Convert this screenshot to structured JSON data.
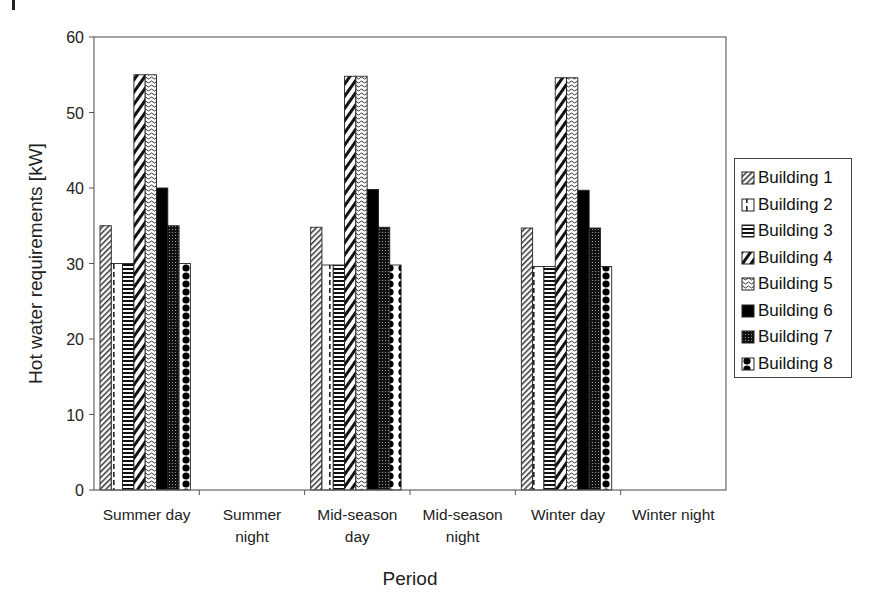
{
  "chart_data": {
    "type": "bar",
    "title": "",
    "xlabel": "Period",
    "ylabel": "Hot water requirements [kW]",
    "ylim": [
      0,
      60
    ],
    "yticks": [
      0,
      10,
      20,
      30,
      40,
      50,
      60
    ],
    "grid": false,
    "legend_position": "right",
    "categories": [
      "Summer day",
      "Summer night",
      "Mid-season day",
      "Mid-season night",
      "Winter day",
      "Winter night"
    ],
    "category_lines": [
      [
        "Summer day"
      ],
      [
        "Summer",
        "night"
      ],
      [
        "Mid-season",
        "day"
      ],
      [
        "Mid-season",
        "night"
      ],
      [
        "Winter day"
      ],
      [
        "Winter night"
      ]
    ],
    "series": [
      {
        "name": "Building 1",
        "pattern": "diag-fine",
        "values": [
          35,
          0,
          34.8,
          0,
          34.7,
          0
        ]
      },
      {
        "name": "Building 2",
        "pattern": "dashed-vertical",
        "values": [
          30,
          0,
          29.8,
          0,
          29.6,
          0
        ]
      },
      {
        "name": "Building 3",
        "pattern": "horizontal-stripes",
        "values": [
          30,
          0,
          29.8,
          0,
          29.6,
          0
        ]
      },
      {
        "name": "Building 4",
        "pattern": "diag-wide",
        "values": [
          55,
          0,
          54.8,
          0,
          54.6,
          0
        ]
      },
      {
        "name": "Building 5",
        "pattern": "wave",
        "values": [
          55,
          0,
          54.8,
          0,
          54.6,
          0
        ]
      },
      {
        "name": "Building 6",
        "pattern": "solid-black",
        "values": [
          40,
          0,
          39.8,
          0,
          39.7,
          0
        ]
      },
      {
        "name": "Building 7",
        "pattern": "dotted-dark",
        "values": [
          35,
          0,
          34.8,
          0,
          34.7,
          0
        ]
      },
      {
        "name": "Building 8",
        "pattern": "scallop",
        "values": [
          30,
          0,
          29.8,
          0,
          29.6,
          0
        ]
      }
    ]
  },
  "colors": {
    "axis": "#555555",
    "bar_fill_dark": "#000000",
    "background": "#ffffff"
  }
}
